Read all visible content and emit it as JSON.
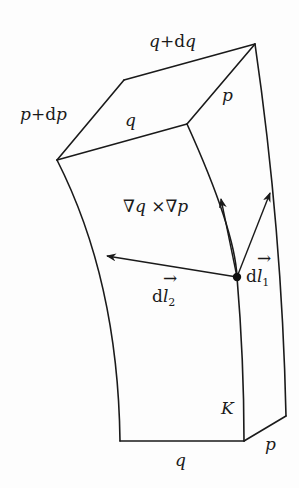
{
  "diagram": {
    "labels": {
      "top_back_edge": "q+dq",
      "top_left_edge": "p+dp",
      "top_front_edge": "q",
      "top_right_edge": "p",
      "gradient_cross": "∇q ×∇p",
      "dl1_d": "d",
      "dl1_l": "l",
      "dl1_sub": "1",
      "dl2_d": "d",
      "dl2_l": "l",
      "dl2_sub": "2",
      "corner": "K",
      "bottom_front_edge": "q",
      "bottom_right_edge": "p"
    },
    "colors": {
      "stroke": "#1a1a1a",
      "background": "#fdfdfd"
    }
  }
}
